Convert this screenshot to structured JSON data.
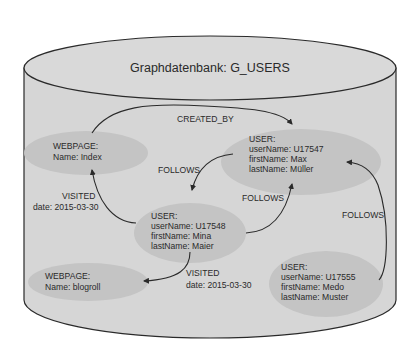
{
  "database": {
    "title": "Graphdatenbank: G_USERS",
    "colors": {
      "cylinder_fill": "#d6d6d6",
      "cylinder_top_fill": "#d9d9d9",
      "node_fill": "#c4c4c4",
      "stroke": "#2a2a2a",
      "text": "#2a2a2a"
    }
  },
  "nodes": [
    {
      "id": "webpage-index",
      "type": "WEBPAGE:",
      "props": [
        "Name: Index"
      ]
    },
    {
      "id": "user-u17547",
      "type": "USER:",
      "props": [
        "userName: U17547",
        "firstName: Max",
        "lastName: Müller"
      ]
    },
    {
      "id": "user-u17548",
      "type": "USER:",
      "props": [
        "userName: U17548",
        "firstName: Mina",
        "lastName: Maier"
      ]
    },
    {
      "id": "webpage-blogroll",
      "type": "WEBPAGE:",
      "props": [
        "Name: blogroll"
      ]
    },
    {
      "id": "user-u17555",
      "type": "USER:",
      "props": [
        "userName: U17555",
        "firstName: Medo",
        "lastName: Muster"
      ]
    }
  ],
  "edges": [
    {
      "from": "webpage-index",
      "to": "user-u17547",
      "label": "CREATED_BY",
      "prop": ""
    },
    {
      "from": "user-u17547",
      "to": "user-u17548",
      "label": "FOLLOWS",
      "prop": ""
    },
    {
      "from": "user-u17548",
      "to": "user-u17547",
      "label": "FOLLOWS",
      "prop": ""
    },
    {
      "from": "user-u17548",
      "to": "webpage-index",
      "label": "VISITED",
      "prop": "date: 2015-03-30"
    },
    {
      "from": "user-u17548",
      "to": "webpage-blogroll",
      "label": "VISITED",
      "prop": "date: 2015-03-30"
    },
    {
      "from": "user-u17555",
      "to": "user-u17547",
      "label": "FOLLOWS",
      "prop": ""
    }
  ]
}
